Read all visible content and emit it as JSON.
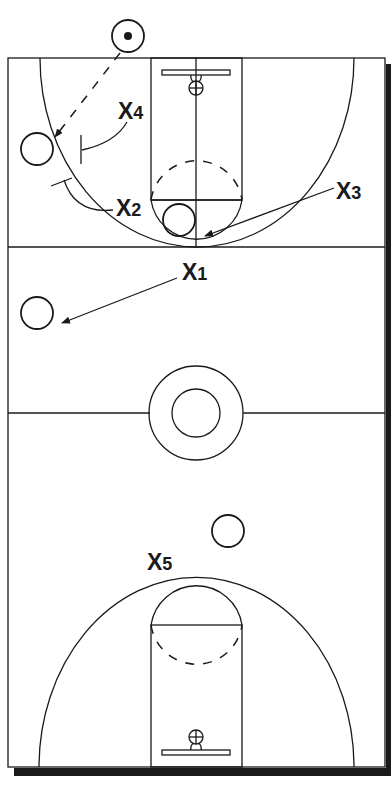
{
  "diagram": {
    "type": "basketball-play-diagram",
    "court": "full-court",
    "colors": {
      "lines": "#1a1a1a",
      "background": "#ffffff",
      "shadow": "#1a1a1a"
    },
    "defenders": [
      {
        "id": "X1",
        "letter": "X",
        "number": "1"
      },
      {
        "id": "X2",
        "letter": "X",
        "number": "2"
      },
      {
        "id": "X3",
        "letter": "X",
        "number": "3"
      },
      {
        "id": "X4",
        "letter": "X",
        "number": "4"
      },
      {
        "id": "X5",
        "letter": "X",
        "number": "5"
      }
    ],
    "offense": [
      {
        "id": "ball-handler",
        "has_ball": true,
        "position": "out-of-bounds top"
      },
      {
        "id": "left-wing",
        "position": "left wing"
      },
      {
        "id": "low-post",
        "position": "lane"
      },
      {
        "id": "left-sideline",
        "position": "left sideline backcourt"
      },
      {
        "id": "backcourt",
        "position": "backcourt right"
      }
    ],
    "actions": [
      {
        "type": "pass",
        "from": "ball-handler",
        "to": "left-wing",
        "style": "dashed-arrow"
      },
      {
        "type": "screen",
        "by": "X4",
        "style": "T-bar"
      },
      {
        "type": "screen",
        "by": "X2",
        "style": "T-bar"
      },
      {
        "type": "cut",
        "by": "X3",
        "style": "arrow"
      },
      {
        "type": "cut",
        "by": "X1",
        "style": "arrow"
      }
    ]
  }
}
